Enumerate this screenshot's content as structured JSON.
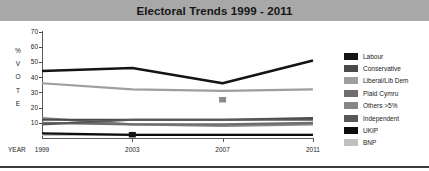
{
  "title": "Electoral Trends 1999 - 2011",
  "axis": {
    "year_label": "YEAR",
    "vertical_label_chars": [
      "%",
      "V",
      "O",
      "T",
      "E"
    ]
  },
  "colors": {
    "title_bar": "#a8a8a8",
    "axis": "#5a5a5a",
    "background": "#ffffff",
    "labour": "#141414",
    "conservative": "#4a4a4a",
    "liberal_lib_dem": "#9e9e9e",
    "plaid_cymru": "#6e6e6e",
    "others": "#868686",
    "independent": "#585858",
    "ukip": "#0d0d0d",
    "bnp": "#c0c0c0"
  },
  "chart_data": {
    "type": "line",
    "title": "Electoral Trends 1999 - 2011",
    "xlabel": "YEAR",
    "ylabel": "% VOTE",
    "x": [
      1999,
      2003,
      2007,
      2011
    ],
    "categories": [
      "1999",
      "2003",
      "2007",
      "2011"
    ],
    "ylim": [
      0,
      70
    ],
    "yticks": [
      10,
      20,
      30,
      40,
      50,
      60,
      70
    ],
    "grid": false,
    "legend_position": "right",
    "series": [
      {
        "name": "Labour",
        "color": "#141414",
        "values": [
          44,
          46,
          36,
          51
        ]
      },
      {
        "name": "Conservative",
        "color": "#4a4a4a",
        "values": [
          12,
          12,
          12,
          13
        ]
      },
      {
        "name": "Liberal/Lib Dem",
        "color": "#9e9e9e",
        "values": [
          36,
          32,
          31,
          32
        ]
      },
      {
        "name": "Plaid Cymru",
        "color": "#6e6e6e",
        "values": [
          10,
          9,
          9,
          10
        ]
      },
      {
        "name": "Others >5%",
        "color": "#868686",
        "values": [
          13,
          9,
          8,
          9
        ]
      },
      {
        "name": "Independent",
        "color": "#585858",
        "values": [
          9,
          12,
          12,
          12
        ]
      },
      {
        "name": "UKIP",
        "color": "#0d0d0d",
        "values": [
          3,
          2,
          2,
          2
        ]
      },
      {
        "name": "BNP",
        "color": "#c0c0c0",
        "values": [
          2,
          2,
          2,
          2
        ]
      }
    ],
    "markers": [
      {
        "name": "marker-2003",
        "x": 2003,
        "y": 2,
        "color": "#141414"
      },
      {
        "name": "marker-2007",
        "x": 2007,
        "y": 25,
        "color": "#8a8a8a"
      }
    ]
  }
}
